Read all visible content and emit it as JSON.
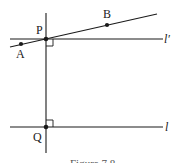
{
  "diagram": {
    "type": "geometry",
    "colors": {
      "stroke": "#1a1a1a",
      "background": "#ffffff"
    },
    "points": [
      {
        "id": "P",
        "label": "P",
        "x": 46,
        "y": 39
      },
      {
        "id": "A",
        "label": "A",
        "x": 21,
        "y": 44
      },
      {
        "id": "B",
        "label": "B",
        "x": 107,
        "y": 25
      },
      {
        "id": "Q",
        "label": "Q",
        "x": 46,
        "y": 127
      }
    ],
    "lines": [
      {
        "id": "l-prime",
        "label": "l′",
        "x1": 10,
        "y1": 39,
        "x2": 163,
        "y2": 39
      },
      {
        "id": "l",
        "label": "l",
        "x1": 10,
        "y1": 127,
        "x2": 163,
        "y2": 127
      },
      {
        "id": "transversal-PQ",
        "label": "",
        "x1": 46,
        "y1": 13,
        "x2": 46,
        "y2": 153
      },
      {
        "id": "line-AB",
        "label": "",
        "x1": 10,
        "y1": 47,
        "x2": 157,
        "y2": 14
      }
    ],
    "right_angles": [
      {
        "at": "P",
        "x": 46,
        "y": 39,
        "dir": "below-right"
      },
      {
        "at": "Q",
        "x": 46,
        "y": 120,
        "dir": "above-right"
      }
    ],
    "labels": {
      "P": "P",
      "A": "A",
      "B": "B",
      "Q": "Q",
      "l_prime": "l′",
      "l": "l",
      "caption": "Figure 7.8"
    }
  }
}
